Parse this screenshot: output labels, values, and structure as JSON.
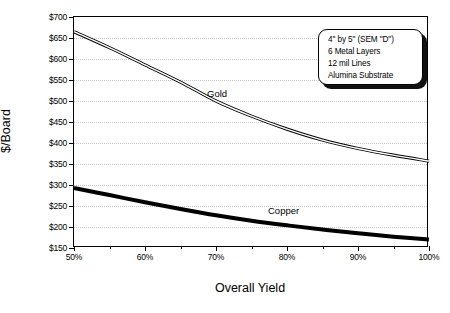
{
  "chart_data": {
    "type": "line",
    "title": "",
    "xlabel": "Overall Yield",
    "ylabel": "$/Board",
    "xlim": [
      50,
      100
    ],
    "ylim": [
      150,
      700
    ],
    "grid": true,
    "legend_position": "inline-labels",
    "x_tick_labels": [
      "50%",
      "60%",
      "70%",
      "80%",
      "90%",
      "100%"
    ],
    "x_tick_values": [
      50,
      60,
      70,
      80,
      90,
      100
    ],
    "x_minor_tick_values": [
      55,
      65,
      75,
      85,
      95
    ],
    "y_tick_labels": [
      "$700",
      "$650",
      "$600",
      "$550",
      "$500",
      "$450",
      "$400",
      "$350",
      "$300",
      "$250",
      "$200",
      "$150"
    ],
    "y_tick_values": [
      700,
      650,
      600,
      550,
      500,
      450,
      400,
      350,
      300,
      250,
      200,
      150
    ],
    "series": [
      {
        "name": "Gold",
        "style": "double-outline-thin",
        "color": "#000000",
        "x": [
          50,
          55,
          60,
          65,
          70,
          75,
          80,
          85,
          90,
          95,
          100
        ],
        "values": [
          665,
          627,
          586,
          545,
          500,
          464,
          433,
          407,
          387,
          371,
          357
        ]
      },
      {
        "name": "Copper",
        "style": "solid-thick",
        "color": "#000000",
        "x": [
          50,
          55,
          60,
          65,
          70,
          75,
          80,
          85,
          90,
          95,
          100
        ],
        "values": [
          293,
          276,
          259,
          243,
          228,
          215,
          204,
          194,
          185,
          177,
          170
        ]
      }
    ],
    "annotations": [
      {
        "name": "spec-callout",
        "lines": [
          "4\" by 5\" (SEM \"D\")",
          "6 Metal Layers",
          "12 mil Lines",
          "Alumina Substrate"
        ]
      }
    ]
  },
  "series_labels": {
    "gold": "Gold",
    "copper": "Copper"
  },
  "callout": {
    "line1": "4\" by 5\" (SEM \"D\")",
    "line2": "6 Metal Layers",
    "line3": "12 mil Lines",
    "line4": "Alumina Substrate"
  },
  "axes": {
    "x_title": "Overall Yield",
    "y_title": "$/Board"
  },
  "colors": {
    "line": "#000000",
    "grid": "#c9c9c9",
    "frame": "#000000",
    "background": "#ffffff"
  }
}
